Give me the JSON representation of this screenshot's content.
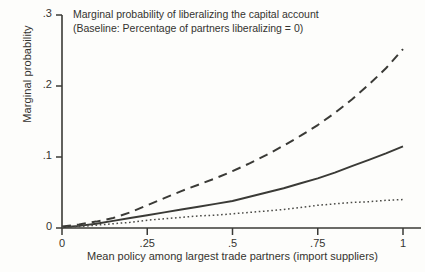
{
  "chart_data": {
    "type": "line",
    "title": "Marginal probability of liberalizing the capital account",
    "subtitle": "(Baseline: Percentage of partners liberalizing = 0)",
    "xlabel": "Mean policy among largest trade partners (import suppliers)",
    "ylabel": "Marginal probability",
    "xlim": [
      0,
      1
    ],
    "ylim": [
      0,
      0.3
    ],
    "grid": false,
    "legend": "none",
    "xticks": [
      0,
      0.25,
      0.5,
      0.75,
      1
    ],
    "xticklabels": [
      "0",
      ".25",
      ".5",
      ".75",
      "1"
    ],
    "yticks": [
      0,
      0.1,
      0.2,
      0.3
    ],
    "yticklabels": [
      "0",
      ".1",
      ".2",
      ".3"
    ],
    "x": [
      0,
      0.05,
      0.1,
      0.15,
      0.2,
      0.25,
      0.3,
      0.35,
      0.4,
      0.45,
      0.5,
      0.55,
      0.6,
      0.65,
      0.7,
      0.75,
      0.8,
      0.85,
      0.9,
      0.95,
      1
    ],
    "series": [
      {
        "name": "upper",
        "style": "dashed",
        "color": "#3a3a36",
        "values": [
          0.002,
          0.005,
          0.009,
          0.014,
          0.022,
          0.032,
          0.042,
          0.052,
          0.061,
          0.07,
          0.08,
          0.091,
          0.103,
          0.116,
          0.13,
          0.145,
          0.162,
          0.181,
          0.202,
          0.225,
          0.252
        ]
      },
      {
        "name": "middle",
        "style": "solid",
        "color": "#3a3a36",
        "values": [
          0.001,
          0.003,
          0.006,
          0.01,
          0.014,
          0.018,
          0.022,
          0.026,
          0.03,
          0.034,
          0.038,
          0.044,
          0.05,
          0.056,
          0.063,
          0.07,
          0.078,
          0.087,
          0.096,
          0.105,
          0.115
        ]
      },
      {
        "name": "lower",
        "style": "dotted",
        "color": "#4a4a46",
        "values": [
          0.001,
          0.002,
          0.004,
          0.006,
          0.008,
          0.011,
          0.013,
          0.015,
          0.017,
          0.018,
          0.02,
          0.022,
          0.024,
          0.026,
          0.029,
          0.032,
          0.034,
          0.036,
          0.037,
          0.039,
          0.04
        ]
      }
    ]
  },
  "axis": {
    "ink": "#3a3a36"
  }
}
